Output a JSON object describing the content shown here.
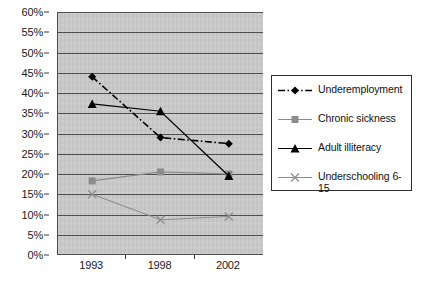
{
  "chart_data": {
    "type": "line",
    "title": "",
    "xlabel": "",
    "ylabel": "",
    "categories": [
      "1993",
      "1998",
      "2002"
    ],
    "x": [
      1993,
      1998,
      2002
    ],
    "ylim": [
      0,
      60
    ],
    "ytick_step": 5,
    "ytick_labels": [
      "0%",
      "5%",
      "10%",
      "15%",
      "20%",
      "25%",
      "30%",
      "35%",
      "40%",
      "45%",
      "50%",
      "55%",
      "60%"
    ],
    "ytick_values": [
      0,
      5,
      10,
      15,
      20,
      25,
      30,
      35,
      40,
      45,
      50,
      55,
      60
    ],
    "grid": true,
    "grid_axis": "y",
    "legend_position": "right",
    "plot_background": "#c9c9c9",
    "series": [
      {
        "name": "Underemployment",
        "values": [
          44.0,
          29.0,
          27.5
        ],
        "marker": "diamond",
        "linestyle": "dash-dot",
        "color": "#000000"
      },
      {
        "name": "Chronic sickness",
        "values": [
          18.3,
          20.5,
          20.0
        ],
        "marker": "square",
        "linestyle": "solid",
        "color": "#8c8c8c"
      },
      {
        "name": "Adult illiteracy",
        "values": [
          37.3,
          35.5,
          19.5
        ],
        "marker": "triangle",
        "linestyle": "solid",
        "color": "#000000"
      },
      {
        "name": "Underschooling 6-15",
        "values": [
          15.0,
          8.7,
          9.5
        ],
        "marker": "x",
        "linestyle": "solid",
        "color": "#8c8c8c"
      }
    ]
  },
  "legend": {
    "entries": [
      {
        "label": "Underemployment"
      },
      {
        "label": "Chronic sickness"
      },
      {
        "label": "Adult illiteracy"
      },
      {
        "label": "Underschooling  6-\n15"
      }
    ]
  },
  "caption": {
    "text": ""
  }
}
